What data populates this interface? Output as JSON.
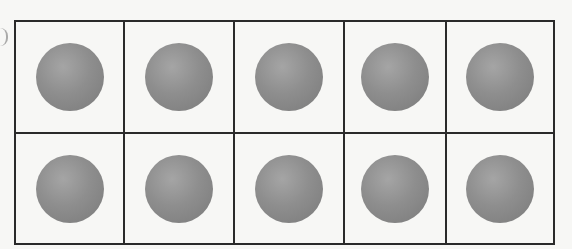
{
  "diagram": {
    "type": "ten-frame",
    "rows": 2,
    "columns": 5,
    "counters": [
      {
        "row": 1,
        "col": 1,
        "filled": true
      },
      {
        "row": 1,
        "col": 2,
        "filled": true
      },
      {
        "row": 1,
        "col": 3,
        "filled": true
      },
      {
        "row": 1,
        "col": 4,
        "filled": true
      },
      {
        "row": 1,
        "col": 5,
        "filled": true
      },
      {
        "row": 2,
        "col": 1,
        "filled": true
      },
      {
        "row": 2,
        "col": 2,
        "filled": true
      },
      {
        "row": 2,
        "col": 3,
        "filled": true
      },
      {
        "row": 2,
        "col": 4,
        "filled": true
      },
      {
        "row": 2,
        "col": 5,
        "filled": true
      }
    ],
    "total_counters": 10,
    "counter_color": "#8e8e8e",
    "grid_color": "#2a2a2a"
  }
}
